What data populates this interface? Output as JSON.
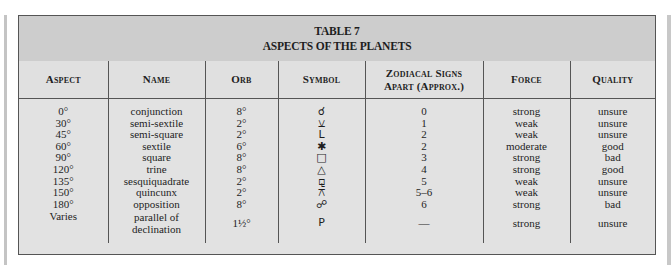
{
  "table": {
    "title_line1": "TABLE 7",
    "title_line2": "ASPECTS OF THE PLANETS",
    "headers": [
      "Aspect",
      "Name",
      "Orb",
      "Symbol",
      "Zodiacal Signs Apart (Approx.)",
      "Force",
      "Quality"
    ],
    "header_zodiac_line1": "Zodiacal Signs",
    "header_zodiac_line2": "Apart (Approx.)",
    "rows": [
      {
        "aspect": "0°",
        "name": "conjunction",
        "orb": "8°",
        "symbol": "☌",
        "symbol_name": "conjunction-symbol-icon",
        "signs_apart": "0",
        "force": "strong",
        "quality": "unsure"
      },
      {
        "aspect": "30°",
        "name": "semi-sextile",
        "orb": "2°",
        "symbol": "⚺",
        "symbol_name": "semi-sextile-symbol-icon",
        "signs_apart": "1",
        "force": "weak",
        "quality": "unsure"
      },
      {
        "aspect": "45°",
        "name": "semi-square",
        "orb": "2°",
        "symbol": "L",
        "symbol_name": "semi-square-symbol-icon",
        "signs_apart": "2",
        "force": "weak",
        "quality": "unsure"
      },
      {
        "aspect": "60°",
        "name": "sextile",
        "orb": "6°",
        "symbol": "✱",
        "symbol_name": "sextile-symbol-icon",
        "signs_apart": "2",
        "force": "moderate",
        "quality": "good"
      },
      {
        "aspect": "90°",
        "name": "square",
        "orb": "8°",
        "symbol": "□",
        "symbol_name": "square-symbol-icon",
        "signs_apart": "3",
        "force": "strong",
        "quality": "bad"
      },
      {
        "aspect": "120°",
        "name": "trine",
        "orb": "8°",
        "symbol": "△",
        "symbol_name": "trine-symbol-icon",
        "signs_apart": "4",
        "force": "strong",
        "quality": "good"
      },
      {
        "aspect": "135°",
        "name": "sesquiquadrate",
        "orb": "2°",
        "symbol": "⚼",
        "symbol_name": "sesquiquadrate-symbol-icon",
        "signs_apart": "5",
        "force": "weak",
        "quality": "unsure"
      },
      {
        "aspect": "150°",
        "name": "quincunx",
        "orb": "2°",
        "symbol": "⚻",
        "symbol_name": "quincunx-symbol-icon",
        "signs_apart": "5–6",
        "force": "weak",
        "quality": "unsure"
      },
      {
        "aspect": "180°",
        "name": "opposition",
        "orb": "8°",
        "symbol": "☍",
        "symbol_name": "opposition-symbol-icon",
        "signs_apart": "6",
        "force": "strong",
        "quality": "bad"
      },
      {
        "aspect": "Varies",
        "name": "parallel of declination",
        "orb": "1½°",
        "symbol": "P",
        "symbol_name": "parallel-symbol-icon",
        "signs_apart": "—",
        "force": "strong",
        "quality": "unsure"
      }
    ]
  }
}
